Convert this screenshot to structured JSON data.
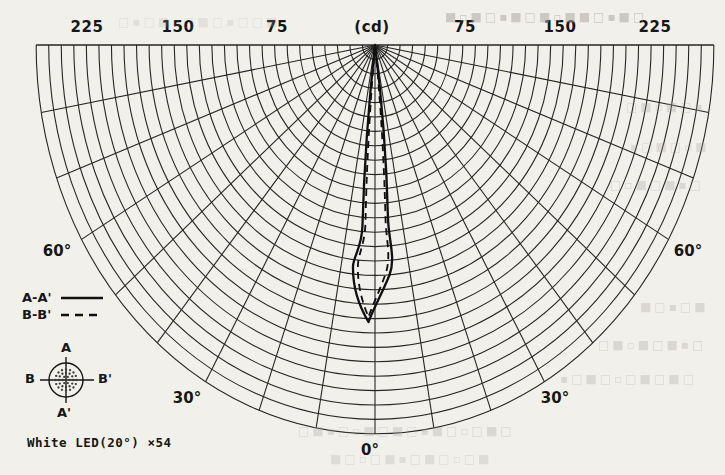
{
  "page": {
    "background": "#f2f0eb",
    "ink": "#1c1c1c",
    "bleed_color": "#a9a49a"
  },
  "chart": {
    "unit_label": "(cd)",
    "scale_labels": [
      "225",
      "150",
      "75",
      "(cd)",
      "75",
      "150",
      "225"
    ],
    "angle_labels": {
      "zero": "0°",
      "thirty_left": "30°",
      "thirty_right": "30°",
      "sixty_left": "60°",
      "sixty_right": "60°"
    }
  },
  "legend": {
    "series_a_label": "A-A'",
    "series_b_label": "B-B'"
  },
  "device_icon": {
    "top_label": "A",
    "bottom_label": "A'",
    "left_label": "B",
    "right_label": "B'"
  },
  "caption": "White LED(20°) ×54",
  "chart_data": {
    "type": "line",
    "subtype": "polar-luminous-intensity-distribution",
    "units": "cd",
    "radial_axis": {
      "unit_label": "(cd)",
      "grid_step_cd": 10,
      "labeled_ticks_cd": [
        75,
        150,
        225
      ],
      "max_cd": 270
    },
    "angular_axis": {
      "range_deg": [
        -90,
        90
      ],
      "grid_step_deg": 10,
      "labeled_angles_deg": [
        0,
        30,
        60
      ],
      "zero_direction": "down"
    },
    "legend_position": "left",
    "grid": true,
    "series": [
      {
        "name": "A-A'",
        "style": "solid",
        "points_deg_cd": [
          [
            -20,
            0
          ],
          [
            -15,
            4
          ],
          [
            -12,
            12
          ],
          [
            -10,
            30
          ],
          [
            -8,
            70
          ],
          [
            -6,
            125
          ],
          [
            -5,
            150
          ],
          [
            -4,
            168
          ],
          [
            -2,
            185
          ],
          [
            0,
            190
          ],
          [
            2,
            185
          ],
          [
            4,
            168
          ],
          [
            5,
            150
          ],
          [
            6,
            125
          ],
          [
            8,
            70
          ],
          [
            10,
            30
          ],
          [
            12,
            12
          ],
          [
            15,
            4
          ],
          [
            20,
            0
          ]
        ]
      },
      {
        "name": "B-B'",
        "style": "dashed",
        "points_deg_cd": [
          [
            -20,
            0
          ],
          [
            -15,
            3
          ],
          [
            -12,
            10
          ],
          [
            -10,
            26
          ],
          [
            -8,
            64
          ],
          [
            -6,
            118
          ],
          [
            -4,
            163
          ],
          [
            -2,
            182
          ],
          [
            0,
            188
          ],
          [
            2,
            182
          ],
          [
            4,
            163
          ],
          [
            6,
            118
          ],
          [
            8,
            64
          ],
          [
            10,
            26
          ],
          [
            12,
            10
          ],
          [
            15,
            3
          ],
          [
            20,
            0
          ]
        ]
      }
    ],
    "annotations": [
      "White LED(20°) ×54",
      "beam measured along A-A' and B-B' axes of the 54-LED cluster"
    ]
  },
  "render": {
    "grid": {
      "cx": 375,
      "cy": 45,
      "rx_step": 12.55,
      "ry_step": 14.4,
      "arc_count": 27,
      "radial_step_deg": 10,
      "grid_color": "#262626",
      "grid_width": 1.1,
      "axis_width": 1.6
    },
    "curve": {
      "solid_path": "M375,45 C368,110 364,170 362.5,225 C362,247 354,255 353,266 C352.5,288 359,306 368.5,322 C373,309 380.5,297 389.5,275 C396,258 388.5,240 388,218 C386.5,158 382,100 375,45 Z",
      "dashed_path": "M375,45 C369.5,110 366.5,170 365.5,222 C365,243 359,252 358,264 C357,283 362,302 368.5,317 C372.5,305 378,295 385.5,274 C391.5,257 386,239 385.5,218 C384,158 380.5,100 375,45 Z",
      "color": "#101010",
      "width": 2.3,
      "dash": "7 5"
    },
    "icon": {
      "cx": 66,
      "cy": 380,
      "r": 17,
      "cross_h": [
        40,
        94
      ],
      "cross_v": [
        357,
        403
      ],
      "dot_rings": [
        [
          0,
          1
        ],
        [
          3.6,
          6
        ],
        [
          7.2,
          12
        ],
        [
          10.6,
          16
        ]
      ],
      "dot_r": 1.15
    },
    "bleed_lines": [
      {
        "x": 445,
        "y": 10,
        "w": 276,
        "o": 0.5,
        "text": "■▫■□▪■□■▫■■□▪■□"
      },
      {
        "x": 118,
        "y": 15,
        "w": 210,
        "o": 0.2,
        "text": "□▪□■▫□■□▪□□■"
      },
      {
        "x": 626,
        "y": 100,
        "w": 96,
        "o": 0.3,
        "text": "□■▫■□▪"
      },
      {
        "x": 630,
        "y": 140,
        "w": 92,
        "o": 0.28,
        "text": "▪□■□▫■"
      },
      {
        "x": 610,
        "y": 178,
        "w": 112,
        "o": 0.3,
        "text": "□▫■□■▪□"
      },
      {
        "x": 640,
        "y": 300,
        "w": 84,
        "o": 0.3,
        "text": "■□▪□■"
      },
      {
        "x": 598,
        "y": 338,
        "w": 124,
        "o": 0.32,
        "text": "□■▫■□■▪□"
      },
      {
        "x": 560,
        "y": 372,
        "w": 162,
        "o": 0.3,
        "text": "▪□■□▫□■□■□"
      },
      {
        "x": 298,
        "y": 424,
        "w": 262,
        "o": 0.3,
        "text": "□■▪□▫■□■□▪■□▫□■□"
      },
      {
        "x": 330,
        "y": 452,
        "w": 222,
        "o": 0.26,
        "text": "■□▫□■▪□■□▫□■"
      }
    ]
  }
}
